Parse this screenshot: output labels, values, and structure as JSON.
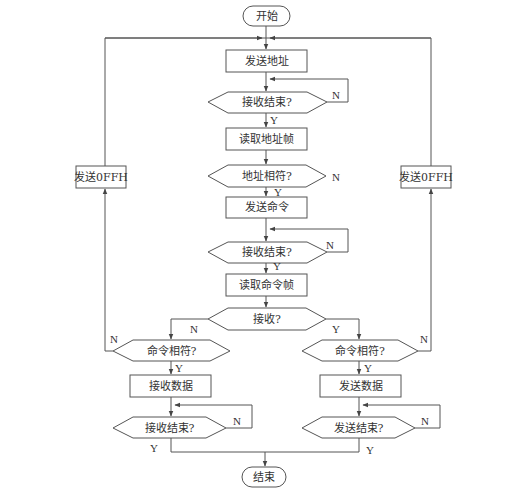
{
  "diagram": {
    "type": "flowchart",
    "colors": {
      "stroke": "#555555",
      "text": "#333333",
      "background": "#ffffff"
    },
    "nodes": {
      "start": {
        "label": "开始",
        "shape": "terminator"
      },
      "send_address": {
        "label": "发送地址",
        "shape": "process"
      },
      "recv_done_1": {
        "label": "接收结束?",
        "shape": "decision"
      },
      "read_address_frame": {
        "label": "读取地址帧",
        "shape": "process"
      },
      "address_match": {
        "label": "地址相符?",
        "shape": "decision"
      },
      "send_command": {
        "label": "发送命令",
        "shape": "process"
      },
      "recv_done_2": {
        "label": "接收结束?",
        "shape": "decision"
      },
      "read_command_frame": {
        "label": "读取命令帧",
        "shape": "process"
      },
      "receive_q": {
        "label": "接收?",
        "shape": "decision"
      },
      "cmd_match_left": {
        "label": "命令相符?",
        "shape": "decision"
      },
      "cmd_match_right": {
        "label": "命令相符?",
        "shape": "decision"
      },
      "receive_data": {
        "label": "接收数据",
        "shape": "process"
      },
      "send_data": {
        "label": "发送数据",
        "shape": "process"
      },
      "recv_done_3": {
        "label": "接收结束?",
        "shape": "decision"
      },
      "send_done": {
        "label": "发送结束?",
        "shape": "decision"
      },
      "send_0ffh_left": {
        "label": "发送0FFH",
        "shape": "process"
      },
      "send_0ffh_right": {
        "label": "发送0FFH",
        "shape": "process"
      },
      "end": {
        "label": "结束",
        "shape": "terminator"
      }
    },
    "edge_labels": {
      "yes": "Y",
      "no": "N"
    }
  }
}
